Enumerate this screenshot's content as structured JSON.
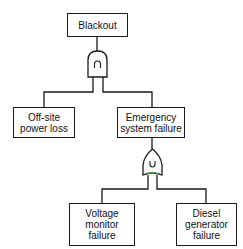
{
  "diagram": {
    "type": "fault-tree",
    "top_event": {
      "label": "Blackout"
    },
    "gates": [
      {
        "id": "and-gate",
        "type": "AND",
        "symbol": "∩",
        "output": "Blackout",
        "inputs": [
          "Off-site power loss",
          "Emergency system failure"
        ]
      },
      {
        "id": "or-gate",
        "type": "OR",
        "symbol": "∪",
        "output": "Emergency system failure",
        "inputs": [
          "Voltage monitor failure",
          "Diesel generator failure"
        ]
      }
    ],
    "events": {
      "blackout": [
        "Blackout"
      ],
      "offsite": [
        "Off-site",
        "power loss"
      ],
      "emergency": [
        "Emergency",
        "system failure"
      ],
      "voltage": [
        "Voltage",
        "monitor",
        "failure"
      ],
      "diesel": [
        "Diesel",
        "generator",
        "failure"
      ]
    },
    "colors": {
      "line": "#1a1a1a",
      "or_gate_accent": "#3cb043"
    }
  }
}
